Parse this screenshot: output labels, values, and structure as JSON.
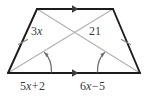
{
  "figure": {
    "type": "isosceles-trapezoid-with-diagonals",
    "labels": {
      "diagonal_left_segment": "3x",
      "diagonal_left_coefficient": "3",
      "diagonal_left_variable": "x",
      "diagonal_right_segment": "21",
      "base_left_expression": "5x + 2",
      "base_left_coefficient": "5",
      "base_left_variable": "x",
      "base_left_operator": "+",
      "base_left_constant": "2",
      "base_right_expression": "6x − 5",
      "base_right_coefficient": "6",
      "base_right_variable": "x",
      "base_right_operator": "−",
      "base_right_constant": "5"
    },
    "colors": {
      "outline": "#1c1c1c",
      "diagonal": "#b0b0b0",
      "arc": "#6e6e6e",
      "tick": "#8a8a8a",
      "arrow": "#3c3c3c",
      "label_text": "#3a3a3a",
      "background": "#ffffff"
    },
    "vertices": {
      "top_left": [
        37,
        9
      ],
      "top_right": [
        113,
        9
      ],
      "bottom_right": [
        140,
        73
      ],
      "bottom_left": [
        8,
        73
      ],
      "diagonal_intersection": [
        75,
        42
      ]
    },
    "markings": {
      "parallel_marks": 2,
      "leg_tick_marks": 2,
      "base_angle_arcs": 2
    }
  }
}
